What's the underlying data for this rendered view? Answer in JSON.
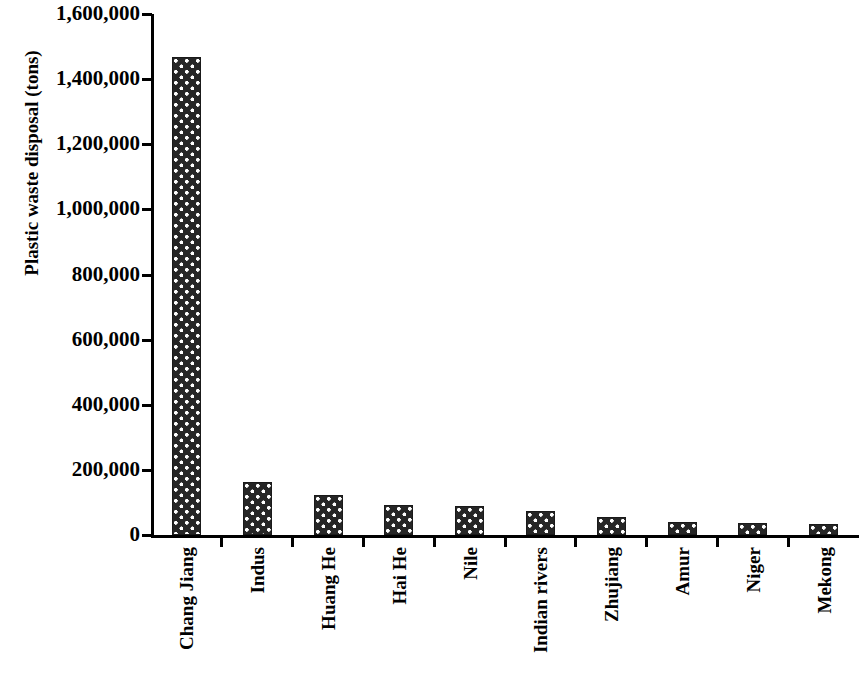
{
  "chart_data": {
    "type": "bar",
    "title": "",
    "xlabel": "",
    "ylabel": "Plastic waste disposal (tons)",
    "ylim": [
      0,
      1600000
    ],
    "ytick_step": 200000,
    "grid": false,
    "legend": null,
    "bar_fill_color": "#262626",
    "bar_pattern": "dark fill with white dot grid",
    "categories": [
      "Chang Jiang",
      "Indus",
      "Huang He",
      "Hai He",
      "Nile",
      "Indian rivers",
      "Zhujiang",
      "Amur",
      "Niger",
      "Mekong"
    ],
    "values": [
      1468000,
      164000,
      124000,
      92000,
      89000,
      75000,
      54000,
      41000,
      38000,
      33000
    ],
    "ytick_labels": [
      "0",
      "200,000",
      "400,000",
      "600,000",
      "800,000",
      "1,000,000",
      "1,200,000",
      "1,400,000",
      "1,600,000"
    ],
    "ytick_values": [
      0,
      200000,
      400000,
      600000,
      800000,
      1000000,
      1200000,
      1400000,
      1600000
    ]
  }
}
